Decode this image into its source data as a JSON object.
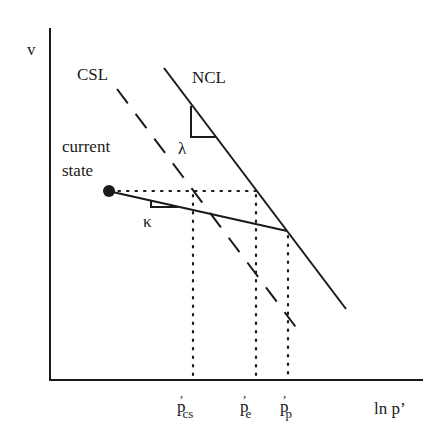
{
  "diagram": {
    "type": "soil-mechanics-state-diagram",
    "axes": {
      "y_label": "v",
      "x_label": "ln p’"
    },
    "lines": {
      "ncl_label": "NCL",
      "csl_label": "CSL"
    },
    "slopes": {
      "lambda": "λ",
      "kappa": "κ"
    },
    "point": {
      "label_line1": "current",
      "label_line2": "state"
    },
    "ticks": [
      {
        "base": "p",
        "prime": "’",
        "sub": "cs"
      },
      {
        "base": "p",
        "prime": "’",
        "sub": "e"
      },
      {
        "base": "p",
        "prime": "’",
        "sub": "p"
      }
    ],
    "colors": {
      "ink": "#1a1a1a",
      "background": "#ffffff"
    }
  }
}
